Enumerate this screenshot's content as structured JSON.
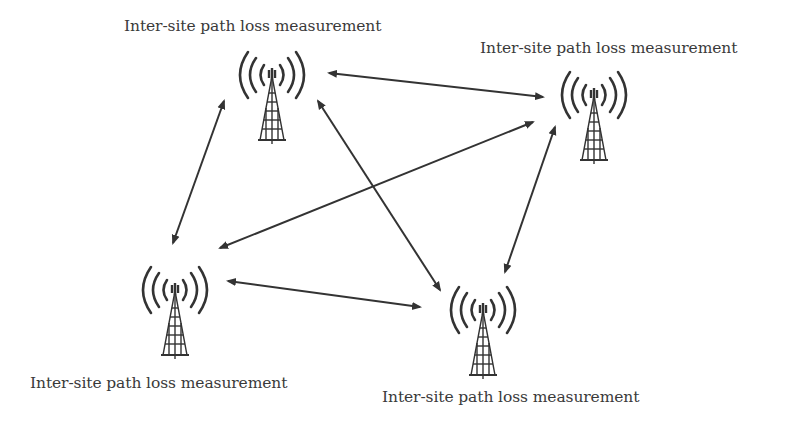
{
  "diagram": {
    "type": "network-topology",
    "colors": {
      "line": "#333333",
      "text": "#3a3a3a",
      "background": "#ffffff"
    },
    "sites": [
      {
        "id": "site-top-left",
        "label": "Inter-site path loss measurement",
        "icon": "radio-tower-icon"
      },
      {
        "id": "site-top-right",
        "label": "Inter-site path loss measurement",
        "icon": "radio-tower-icon"
      },
      {
        "id": "site-bottom-left",
        "label": "Inter-site path loss measurement",
        "icon": "radio-tower-icon"
      },
      {
        "id": "site-bottom-middle",
        "label": "Inter-site path loss measurement",
        "icon": "radio-tower-icon"
      }
    ],
    "links": [
      {
        "from": "site-top-left",
        "to": "site-top-right",
        "style": "double-arrow"
      },
      {
        "from": "site-top-left",
        "to": "site-bottom-left",
        "style": "double-arrow"
      },
      {
        "from": "site-top-left",
        "to": "site-bottom-middle",
        "style": "double-arrow"
      },
      {
        "from": "site-top-right",
        "to": "site-bottom-left",
        "style": "double-arrow"
      },
      {
        "from": "site-top-right",
        "to": "site-bottom-middle",
        "style": "double-arrow"
      },
      {
        "from": "site-bottom-left",
        "to": "site-bottom-middle",
        "style": "double-arrow"
      }
    ]
  }
}
